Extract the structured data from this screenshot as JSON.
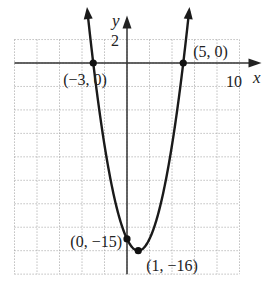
{
  "chart_data": {
    "type": "line",
    "title": "",
    "function": "y = x^2 - 2x - 15",
    "xlabel": "x",
    "ylabel": "y",
    "xlim": [
      -10,
      10
    ],
    "ylim": [
      -18,
      2
    ],
    "grid": true,
    "grid_step": 2,
    "tick_labels": {
      "x": "10",
      "y": "2"
    },
    "points": [
      {
        "x": -3,
        "y": 0,
        "label": "(−3, 0)"
      },
      {
        "x": 5,
        "y": 0,
        "label": "(5, 0)"
      },
      {
        "x": 0,
        "y": -15,
        "label": "(0, −15)"
      },
      {
        "x": 1,
        "y": -16,
        "label": "(1, −16)"
      }
    ],
    "legend": null
  }
}
